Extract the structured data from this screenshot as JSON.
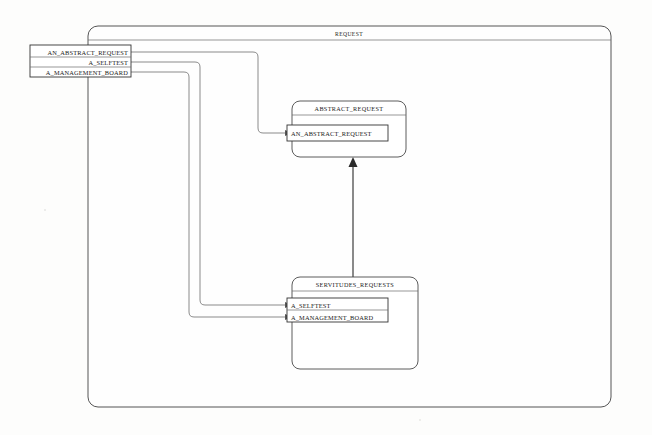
{
  "diagram": {
    "type": "block-definition-diagram",
    "outer_container": {
      "label": "REQUEST"
    },
    "external_port_group": {
      "name": "request-ports",
      "ports": [
        {
          "label": "AN_ABSTRACT_REQUEST"
        },
        {
          "label": "A_SELFTEST"
        },
        {
          "label": "A_MANAGEMENT_BOARD"
        }
      ]
    },
    "blocks": [
      {
        "id": "abstract-request",
        "title": "ABSTRACT_REQUEST",
        "ports": [
          {
            "label": "AN_ABSTRACT_REQUEST"
          }
        ]
      },
      {
        "id": "servitudes-requests",
        "title": "SERVITUDES_REQUESTS",
        "ports": [
          {
            "label": "A_SELFTEST"
          },
          {
            "label": "A_MANAGEMENT_BOARD"
          }
        ]
      }
    ],
    "connectors": [
      {
        "name": "an-abstract-request-connector",
        "from": "AN_ABSTRACT_REQUEST",
        "to": "AN_ABSTRACT_REQUEST"
      },
      {
        "name": "a-selftest-connector",
        "from": "A_SELFTEST",
        "to": "A_SELFTEST"
      },
      {
        "name": "a-management-board-connector",
        "from": "A_MANAGEMENT_BOARD",
        "to": "A_MANAGEMENT_BOARD"
      },
      {
        "name": "generalization-connector",
        "from": "SERVITUDES_REQUESTS",
        "to": "ABSTRACT_REQUEST"
      }
    ],
    "colors": {
      "line": "#777777",
      "inherit_line": "#2a2a2a",
      "block_border": "#4a4a4a",
      "text": "#1a1a1a",
      "background": "#fdfdfc"
    }
  }
}
